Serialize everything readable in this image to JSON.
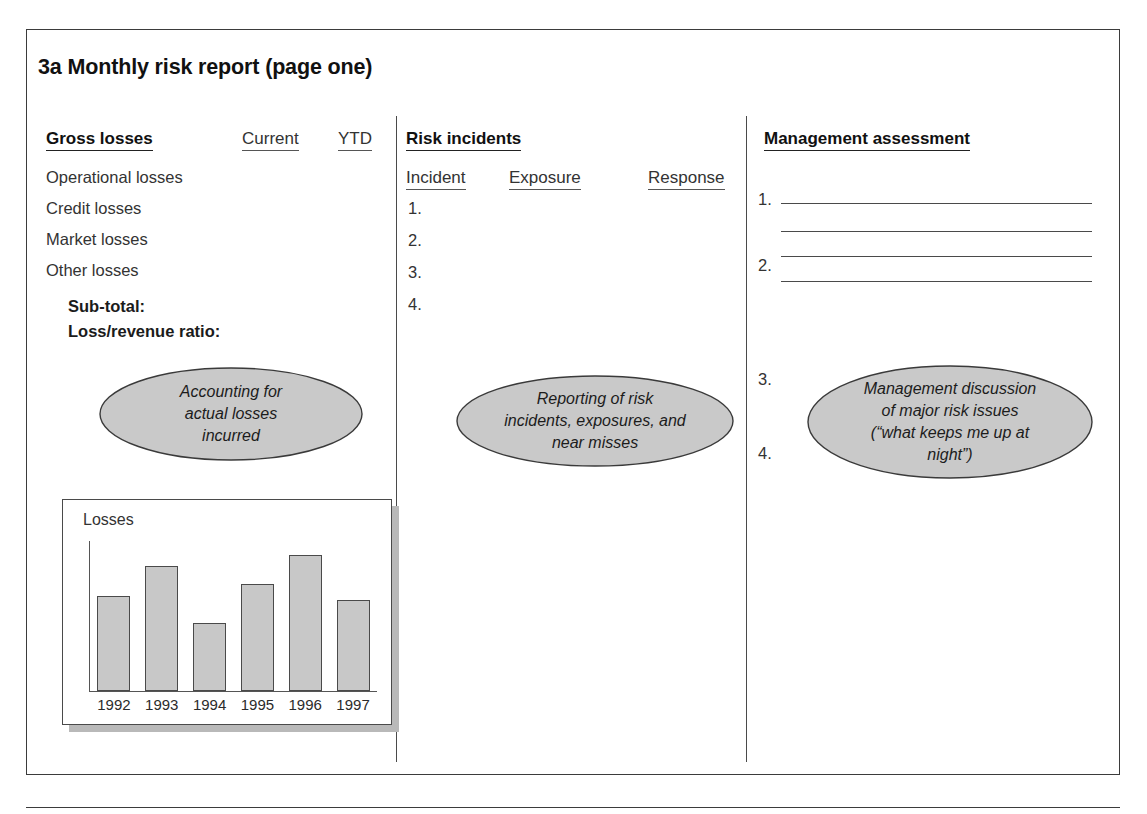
{
  "figure": {
    "title": "3a Monthly risk report (page one)"
  },
  "columns": {
    "gross_losses": {
      "heading": "Gross losses",
      "col_headers": [
        "Current",
        "YTD"
      ],
      "rows": [
        "Operational losses",
        "Credit losses",
        "Market losses",
        "Other losses"
      ],
      "totals": [
        "Sub-total:",
        "Loss/revenue ratio:"
      ],
      "callout": [
        "Accounting for",
        "actual losses",
        "incurred"
      ]
    },
    "risk_incidents": {
      "heading": "Risk incidents",
      "col_headers": [
        "Incident",
        "Exposure",
        "Response"
      ],
      "items": [
        "1.",
        "2.",
        "3.",
        "4."
      ],
      "callout": [
        "Reporting of risk",
        "incidents, exposures, and",
        "near misses"
      ]
    },
    "management_assessment": {
      "heading": "Management assessment",
      "items": [
        "1.",
        "2.",
        "3.",
        "4."
      ],
      "rule_count": 4,
      "callout": [
        "Management discussion",
        "of major risk issues",
        "(“what keeps me up at",
        "night”)"
      ]
    }
  },
  "chart_data": {
    "type": "bar",
    "title": "",
    "ylabel": "Losses",
    "xlabel": "",
    "categories": [
      "1992",
      "1993",
      "1994",
      "1995",
      "1996",
      "1997"
    ],
    "values": [
      70,
      92,
      50,
      79,
      100,
      67
    ],
    "ylim": [
      0,
      110
    ],
    "grid": false,
    "legend": "none",
    "bar_color": "#c8c8c8",
    "bar_border_color": "#4a4a4a"
  },
  "style": {
    "frame_color": "#3b3b3b",
    "divider_color": "#4a4a4a",
    "callout_fill": "#c9c9c9",
    "callout_stroke": "#3a3a3a",
    "text_color": "#1a1a1a"
  }
}
